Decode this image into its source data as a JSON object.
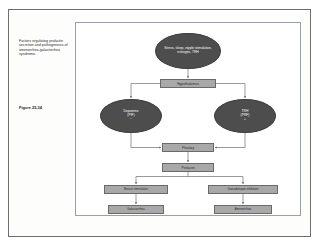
{
  "slide": {
    "caption": "Factors regulating prolactin secretion and pathogenesis of amenorrhea-galactorrhea syndrome.",
    "figure_number": "Figure 25-34"
  },
  "colors": {
    "ellipse_fill": "#4d4d4d",
    "box_fill": "#a8a8a8",
    "box_border": "#6a6a6a",
    "diagram_border": "#9aa0b4",
    "page_border": "#6e6e6e",
    "connector": "#707070",
    "ellipse_text": "#ffffff",
    "box_text": "#2a2a2a"
  },
  "diagram": {
    "type": "flowchart",
    "nodes": [
      {
        "id": "stress",
        "shape": "ellipse",
        "label": "Stress, sleep, nipple stimulation,\nestrogen, TRH"
      },
      {
        "id": "hypothalamus",
        "shape": "box",
        "label": "Hypothalamus"
      },
      {
        "id": "dopamine",
        "shape": "ellipse",
        "label": "Dopamine\n(PIF)\n−"
      },
      {
        "id": "trh",
        "shape": "ellipse",
        "label": "TRH\n(PRF)\n+"
      },
      {
        "id": "pituitary",
        "shape": "box",
        "label": "Pituitary"
      },
      {
        "id": "prolactin",
        "shape": "box",
        "label": "Prolactin"
      },
      {
        "id": "breast",
        "shape": "box",
        "label": "Breast stimulation"
      },
      {
        "id": "gonadotropin",
        "shape": "box",
        "label": "Gonadotropin inhibition"
      },
      {
        "id": "galactorrhea",
        "shape": "box",
        "label": "Galactorrhea"
      },
      {
        "id": "amenorrhea",
        "shape": "box",
        "label": "Amenorrhea"
      }
    ],
    "edges": [
      {
        "from": "stress",
        "to": "hypothalamus",
        "arrow": true
      },
      {
        "from": "hypothalamus",
        "to": "dopamine",
        "arrow": true
      },
      {
        "from": "hypothalamus",
        "to": "trh",
        "arrow": true
      },
      {
        "from": "dopamine",
        "to": "pituitary",
        "arrow": true
      },
      {
        "from": "trh",
        "to": "pituitary",
        "arrow": true
      },
      {
        "from": "pituitary",
        "to": "prolactin",
        "arrow": true
      },
      {
        "from": "prolactin",
        "to": "breast",
        "arrow": true
      },
      {
        "from": "prolactin",
        "to": "gonadotropin",
        "arrow": true
      },
      {
        "from": "breast",
        "to": "galactorrhea",
        "arrow": true
      },
      {
        "from": "gonadotropin",
        "to": "amenorrhea",
        "arrow": true
      }
    ]
  }
}
